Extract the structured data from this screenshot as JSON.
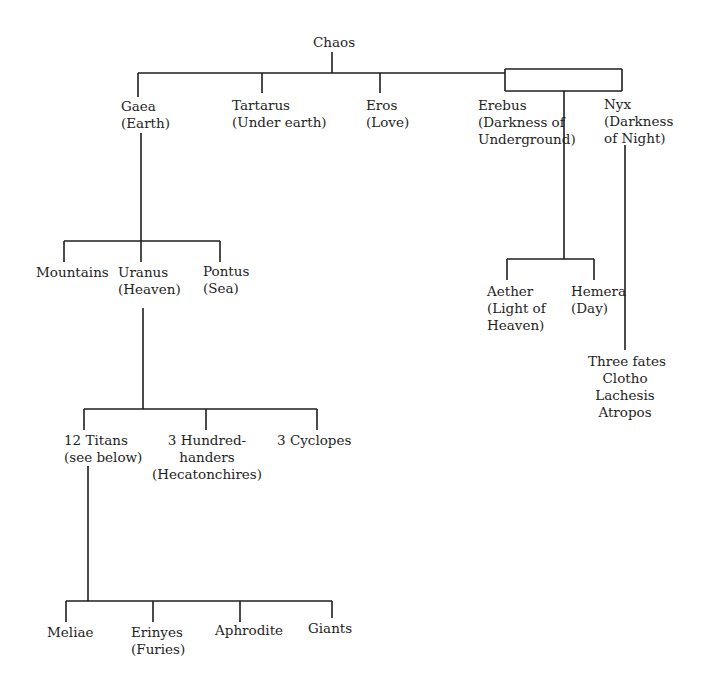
{
  "line_color": "#1e1e1e",
  "nodes": {
    "chaos": {
      "lines": [
        "Chaos"
      ]
    },
    "gaea": {
      "lines": [
        "Gaea",
        "(Earth)"
      ]
    },
    "tartarus": {
      "lines": [
        "Tartarus",
        "(Under earth)"
      ]
    },
    "eros": {
      "lines": [
        "Eros",
        "(Love)"
      ]
    },
    "erebus": {
      "lines": [
        "Erebus",
        "(Darkness of",
        "Underground)"
      ]
    },
    "nyx": {
      "lines": [
        "Nyx",
        "(Darkness",
        "of Night)"
      ]
    },
    "mountains": {
      "lines": [
        "Mountains"
      ]
    },
    "uranus": {
      "lines": [
        "Uranus",
        "(Heaven)"
      ]
    },
    "pontus": {
      "lines": [
        "Pontus",
        "(Sea)"
      ]
    },
    "aether": {
      "lines": [
        "Aether",
        "(Light of",
        "Heaven)"
      ]
    },
    "hemera": {
      "lines": [
        "Hemera",
        "(Day)"
      ]
    },
    "fates": {
      "lines": [
        "Three fates",
        "Clotho",
        "Lachesis",
        "Atropos"
      ]
    },
    "titans": {
      "lines": [
        "12 Titans",
        "(see below)"
      ]
    },
    "hundred_handers": {
      "lines": [
        "3 Hundred-",
        "handers",
        "(Hecatonchires)"
      ]
    },
    "cyclopes": {
      "lines": [
        "3 Cyclopes"
      ]
    },
    "meliae": {
      "lines": [
        "Meliae"
      ]
    },
    "erinyes": {
      "lines": [
        "Erinyes",
        "(Furies)"
      ]
    },
    "aphrodite": {
      "lines": [
        "Aphrodite"
      ]
    },
    "giants": {
      "lines": [
        "Giants"
      ]
    }
  }
}
